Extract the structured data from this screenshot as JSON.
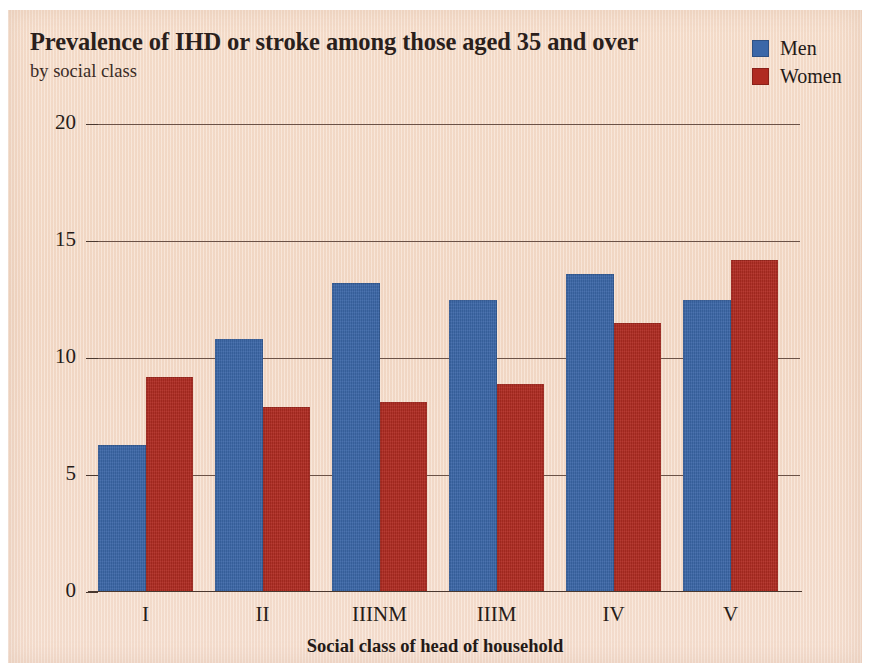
{
  "header": {
    "title": "Prevalence of IHD or stroke among those aged 35 and over",
    "subtitle": "by social class"
  },
  "legend": {
    "position": "top-right",
    "entries": [
      {
        "label": "Men",
        "color": "#3b67a8",
        "swatch": "men-swatch"
      },
      {
        "label": "Women",
        "color": "#b02b21",
        "swatch": "women-swatch"
      }
    ]
  },
  "colors": {
    "men": "#3b67a8",
    "women": "#b02b21",
    "paper": "#f4d9c6",
    "axis": "#4a382f",
    "gridline": "#6b5247",
    "text": "#271c18"
  },
  "chart_data": {
    "type": "bar",
    "title": "Prevalence of IHD or stroke among those aged 35 and over",
    "subtitle": "by social class",
    "xlabel": "Social class of head of household",
    "ylabel": "Percent",
    "categories": [
      "I",
      "II",
      "IIINM",
      "IIIM",
      "IV",
      "V"
    ],
    "series": [
      {
        "name": "Men",
        "color": "#3b67a8",
        "values": [
          6.3,
          10.8,
          13.2,
          12.5,
          13.6,
          12.5
        ]
      },
      {
        "name": "Women",
        "color": "#b02b21",
        "values": [
          9.2,
          7.9,
          8.1,
          8.9,
          11.5,
          14.2
        ]
      }
    ],
    "ylim": [
      0,
      20
    ],
    "yticks": [
      0,
      5,
      10,
      15,
      20
    ],
    "ytick_labels": [
      "0",
      "5",
      "10",
      "15",
      "20"
    ],
    "grid": true,
    "grid_axis": "y",
    "legend_position": "top-right"
  }
}
